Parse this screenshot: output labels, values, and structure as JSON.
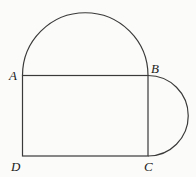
{
  "figure": {
    "points": {
      "A": {
        "label": "A",
        "x": 22.5,
        "y": 75.5
      },
      "B": {
        "label": "B",
        "x": 148,
        "y": 75.5
      },
      "C": {
        "label": "C",
        "x": 148,
        "y": 156
      },
      "D": {
        "label": "D",
        "x": 22.5,
        "y": 156
      }
    },
    "labels": {
      "A": "A",
      "B": "B",
      "C": "C",
      "D": "D"
    },
    "colors": {
      "stroke": "#3a3a3a",
      "background": "#fbfbf9",
      "text": "#1a1a1a"
    }
  }
}
